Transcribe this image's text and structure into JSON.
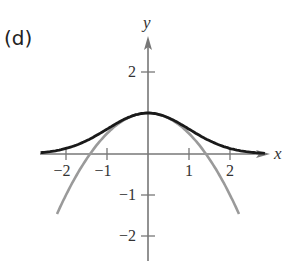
{
  "panel": {
    "label": "(d)"
  },
  "axes": {
    "x_label": "x",
    "y_label": "y",
    "x_ticks": [
      {
        "value": -2,
        "label": "−2"
      },
      {
        "value": -1,
        "label": "−1"
      },
      {
        "value": 1,
        "label": "1"
      },
      {
        "value": 2,
        "label": "2"
      }
    ],
    "y_ticks": [
      {
        "value": 2,
        "label": "2"
      },
      {
        "value": -1,
        "label": "−1"
      },
      {
        "value": -2,
        "label": "−2"
      }
    ]
  },
  "colors": {
    "axis": "#777777",
    "curve_f": "#1a1a1a",
    "curve_p": "#9a9a9a"
  },
  "chart_data": {
    "type": "line",
    "title": "(d)",
    "xlabel": "x",
    "ylabel": "y",
    "xlim": [
      -2.6,
      2.9
    ],
    "ylim": [
      -2.6,
      2.8
    ],
    "grid": false,
    "legend": null,
    "x_ticks": [
      -2,
      -1,
      1,
      2
    ],
    "y_ticks": [
      2,
      -1,
      -2
    ],
    "series": [
      {
        "name": "f(x) = e^(-x^2/2)",
        "color": "#1a1a1a",
        "x": [
          -2.6,
          -2,
          -1.5,
          -1,
          -0.5,
          0,
          0.5,
          1,
          1.5,
          2,
          2.6
        ],
        "y": [
          0.034,
          0.135,
          0.325,
          0.607,
          0.882,
          1.0,
          0.882,
          0.607,
          0.325,
          0.135,
          0.034
        ]
      },
      {
        "name": "P(x) = 1 - x^2/2",
        "color": "#9a9a9a",
        "x": [
          -2.2,
          -2,
          -1.5,
          -1,
          -0.5,
          0,
          0.5,
          1,
          1.5,
          2,
          2.2
        ],
        "y": [
          -1.42,
          -1.0,
          -0.125,
          0.5,
          0.875,
          1.0,
          0.875,
          0.5,
          -0.125,
          -1.0,
          -1.42
        ]
      }
    ]
  }
}
